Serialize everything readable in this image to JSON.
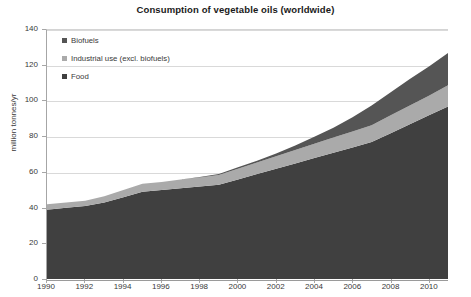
{
  "chart_data": {
    "type": "area",
    "stacked": true,
    "title": "Consumption of vegetable oils (worldwide)",
    "xlabel": "",
    "ylabel": "million tonnes/yr",
    "ylim": [
      0,
      140
    ],
    "ytick_step": 20,
    "yticks": [
      "0",
      "20",
      "40",
      "60",
      "80",
      "100",
      "120",
      "140"
    ],
    "xlim": [
      1990,
      2011
    ],
    "xticks": [
      "1990",
      "1992",
      "1994",
      "1996",
      "1998",
      "2000",
      "2002",
      "2004",
      "2006",
      "2008",
      "2010"
    ],
    "grid": true,
    "legend_position": "top-left",
    "x": [
      1990,
      1991,
      1992,
      1993,
      1994,
      1995,
      1996,
      1997,
      1998,
      1999,
      2000,
      2001,
      2002,
      2003,
      2004,
      2005,
      2006,
      2007,
      2008,
      2009,
      2010,
      2011
    ],
    "series": [
      {
        "name": "Food",
        "color": "#404040",
        "values": [
          39,
          40,
          41,
          43,
          46,
          49,
          50,
          51,
          52,
          53,
          56,
          59,
          62,
          65,
          68,
          71,
          74,
          77,
          82,
          87,
          92,
          97
        ]
      },
      {
        "name": "Industrial use (excl. biofuels)",
        "color": "#aaaaaa",
        "values": [
          3,
          3,
          3,
          3.5,
          4,
          4.5,
          4.5,
          5,
          5,
          5.5,
          6,
          6.5,
          7,
          7.5,
          8,
          8.5,
          9,
          9.5,
          10,
          10.5,
          11,
          12
        ]
      },
      {
        "name": "Biofuels",
        "color": "#555555",
        "values": [
          0,
          0,
          0,
          0,
          0,
          0,
          0,
          0,
          0.3,
          0.5,
          0.8,
          1,
          1.5,
          2.5,
          4,
          5.5,
          8,
          11,
          13,
          15,
          16.5,
          18
        ]
      }
    ],
    "totals_note": "",
    "colors": {
      "food": "#404040",
      "industrial": "#aaaaaa",
      "biofuels": "#555555",
      "gridline": "#d9d9d9",
      "axis": "#a6a6a6",
      "text": "#3a3a3a",
      "title": "#1a1a1a",
      "background": "#ffffff"
    }
  }
}
